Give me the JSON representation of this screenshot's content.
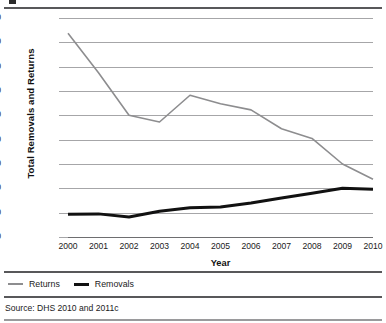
{
  "chart_data": {
    "type": "line",
    "title": "",
    "xlabel": "Year",
    "ylabel": "Total Removals and Returns",
    "categories": [
      "2000",
      "2001",
      "2002",
      "2003",
      "2004",
      "2005",
      "2006",
      "2007",
      "2008",
      "2009",
      "2010"
    ],
    "ylim": [
      0,
      1800000
    ],
    "ytick_step": 200000,
    "ytick_labels": [
      "1,800,000",
      "1,600,000",
      "1,400,000",
      "1,200,000",
      "1,000,000",
      "800,000",
      "600,000",
      "400,000",
      "200,000",
      "0"
    ],
    "ytick_values": [
      1800000,
      1600000,
      1400000,
      1200000,
      1000000,
      800000,
      600000,
      400000,
      200000,
      0
    ],
    "grid": true,
    "legend_position": "bottom-left",
    "series": [
      {
        "name": "Returns",
        "color": "#8d8d8f",
        "width": 1.6,
        "values": [
          1675000,
          1350000,
          1000000,
          945000,
          1165000,
          1095000,
          1045000,
          890000,
          810000,
          600000,
          475000
        ]
      },
      {
        "name": "Removals",
        "color": "#111111",
        "width": 3.0,
        "values": [
          188000,
          190000,
          165000,
          212000,
          240000,
          246000,
          280000,
          320000,
          360000,
          400000,
          393000
        ]
      }
    ]
  },
  "legend": {
    "items": [
      {
        "label": "Returns"
      },
      {
        "label": "Removals"
      }
    ]
  },
  "axis": {
    "x_title": "Year",
    "y_title": "Total Removals and Returns"
  },
  "footer": {
    "source": "Source: DHS 2010 and 2011c"
  }
}
